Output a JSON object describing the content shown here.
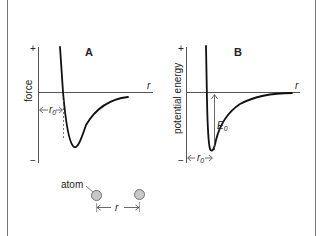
{
  "figure": {
    "panels": [
      {
        "id": "A",
        "title": "A",
        "ylabel": "force",
        "xlabel": "r",
        "y_plus": "+",
        "y_minus": "−",
        "annotations": {
          "r0_label": "r",
          "r0_sub": "0"
        }
      },
      {
        "id": "B",
        "title": "B",
        "ylabel": "potential energy",
        "xlabel": "r",
        "y_plus": "+",
        "y_minus": "−",
        "annotations": {
          "r0_label": "r",
          "r0_sub": "0",
          "e0_label": "E",
          "e0_sub": "0"
        }
      }
    ],
    "atom_diagram": {
      "atom_label": "atom",
      "separation_label": "r"
    },
    "colors": {
      "axis": "#444444",
      "curve": "#111111",
      "atom_fill": "#c8c8c8",
      "atom_stroke": "#555555",
      "border": "#777777"
    }
  }
}
